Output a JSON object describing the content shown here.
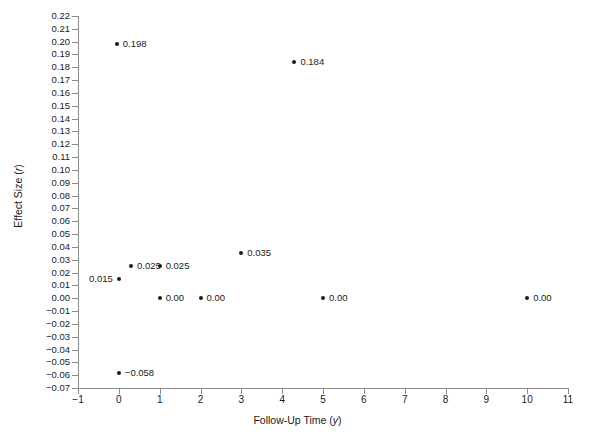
{
  "chart_data": {
    "type": "scatter",
    "title": "",
    "xlabel": "Follow-Up Time (y)",
    "ylabel": "Effect Size (r)",
    "xlim": [
      -1,
      11
    ],
    "ylim": [
      -0.07,
      0.22
    ],
    "grid": false,
    "legend": null,
    "xticks": [
      "-1",
      "0",
      "1",
      "2",
      "3",
      "4",
      "5",
      "6",
      "7",
      "8",
      "9",
      "10",
      "11"
    ],
    "yticks": [
      "0.22",
      "0.21",
      "0.20",
      "0.19",
      "0.18",
      "0.17",
      "0.16",
      "0.15",
      "0.14",
      "0.13",
      "0.12",
      "0.11",
      "0.10",
      "0.09",
      "0.08",
      "0.07",
      "0.06",
      "0.05",
      "0.04",
      "0.03",
      "0.02",
      "0.01",
      "0.00",
      "-0.01",
      "-0.02",
      "-0.03",
      "-0.04",
      "-0.05",
      "-0.06",
      "-0.07"
    ],
    "points": [
      {
        "x": -0.05,
        "y": 0.198,
        "label": "0.198",
        "label_side": "right"
      },
      {
        "x": 4.3,
        "y": 0.184,
        "label": "0.184",
        "label_side": "right"
      },
      {
        "x": 3.0,
        "y": 0.035,
        "label": "0.035",
        "label_side": "right"
      },
      {
        "x": 0.3,
        "y": 0.025,
        "label": "0.025",
        "label_side": "right"
      },
      {
        "x": 1.0,
        "y": 0.025,
        "label": "0.025",
        "label_side": "right"
      },
      {
        "x": 0.0,
        "y": 0.015,
        "label": "0.015",
        "label_side": "left"
      },
      {
        "x": 1.0,
        "y": 0.0,
        "label": "0.00",
        "label_side": "right"
      },
      {
        "x": 2.0,
        "y": 0.0,
        "label": "0.00",
        "label_side": "right"
      },
      {
        "x": 5.0,
        "y": 0.0,
        "label": "0.00",
        "label_side": "right"
      },
      {
        "x": 10.0,
        "y": 0.0,
        "label": "0.00",
        "label_side": "right"
      },
      {
        "x": 0.0,
        "y": -0.058,
        "label": "-0.058",
        "label_side": "right"
      }
    ]
  },
  "axes": {
    "x_title_main": "Follow-Up Time (",
    "x_title_italic": "y",
    "x_title_end": ")",
    "y_title_main": "Effect Size (",
    "y_title_italic": "r",
    "y_title_end": ")"
  }
}
